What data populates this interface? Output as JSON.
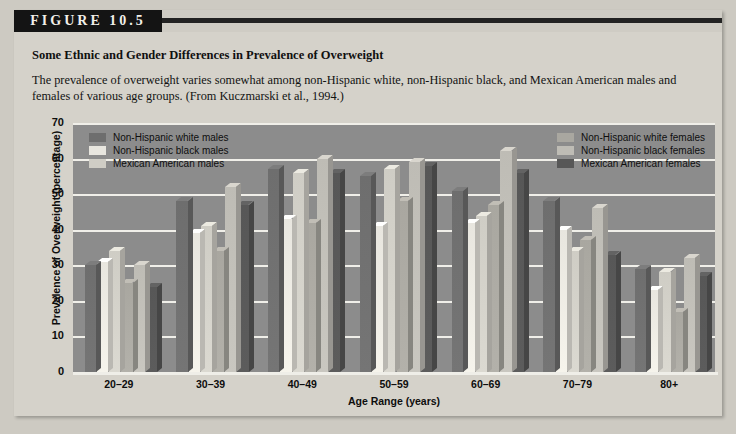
{
  "figure": {
    "banner_label": "FIGURE 10.5",
    "title": "Some Ethnic and Gender Differences in Prevalence of Overweight",
    "caption": "The prevalence of overweight varies somewhat among non-Hispanic white, non-Hispanic black, and Mexican American males and females of various age groups. (From Kuczmarski et al., 1994.)"
  },
  "colors": {
    "plot_background": "#8c8c8c",
    "panel_background": "#d5d2ca",
    "gridline": "#f0efe9",
    "nh_white_males": "#6e6e6e",
    "nh_black_males": "#e8e6df",
    "mexican_american_males": "#cfcdc5",
    "nh_white_females": "#a9a7a0",
    "nh_black_females": "#bebcb5",
    "mexican_american_females": "#575757"
  },
  "chart_data": {
    "type": "bar",
    "title": "Some Ethnic and Gender Differences in Prevalence of Overweight",
    "xlabel": "Age Range (years)",
    "ylabel": "Prevalence of Overweight (percentage)",
    "ylim": [
      0,
      70
    ],
    "yticks": [
      0,
      10,
      20,
      30,
      40,
      50,
      60,
      70
    ],
    "grid": true,
    "legend_position": "inside-top-left and inside-top-right",
    "categories": [
      "20–29",
      "30–39",
      "40–49",
      "50–59",
      "60–69",
      "70–79",
      "80+"
    ],
    "series": [
      {
        "name": "Non-Hispanic white males",
        "key": "nh_white_males",
        "values": [
          30,
          48,
          57,
          55,
          51,
          48,
          29
        ]
      },
      {
        "name": "Non-Hispanic black males",
        "key": "nh_black_males",
        "values": [
          31,
          39,
          43,
          41,
          42,
          40,
          23
        ]
      },
      {
        "name": "Mexican American males",
        "key": "mexican_american_males",
        "values": [
          34,
          41,
          56,
          57,
          44,
          34,
          28
        ]
      },
      {
        "name": "Non-Hispanic white females",
        "key": "nh_white_females",
        "values": [
          25,
          34,
          42,
          48,
          47,
          37,
          17
        ]
      },
      {
        "name": "Non-Hispanic black females",
        "key": "nh_black_females",
        "values": [
          30,
          52,
          60,
          59,
          62,
          46,
          32
        ]
      },
      {
        "name": "Mexican American females",
        "key": "mexican_american_females",
        "values": [
          24,
          47,
          56,
          58,
          56,
          33,
          27
        ]
      }
    ]
  },
  "legend_left": [
    {
      "label": "Non-Hispanic white males",
      "key": "nh_white_males"
    },
    {
      "label": "Non-Hispanic black males",
      "key": "nh_black_males"
    },
    {
      "label": "Mexican American males",
      "key": "mexican_american_males"
    }
  ],
  "legend_right": [
    {
      "label": "Non-Hispanic white females",
      "key": "nh_white_females"
    },
    {
      "label": "Non-Hispanic black females",
      "key": "nh_black_females"
    },
    {
      "label": "Mexican American females",
      "key": "mexican_american_females"
    }
  ]
}
